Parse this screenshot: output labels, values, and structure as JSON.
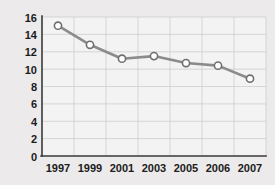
{
  "chart_data": {
    "type": "line",
    "title": "",
    "xlabel": "",
    "ylabel": "",
    "categories": [
      "1997",
      "1999",
      "2001",
      "2003",
      "2005",
      "2006",
      "2007"
    ],
    "values": [
      15.0,
      12.8,
      11.2,
      11.5,
      10.7,
      10.4,
      8.9
    ],
    "series": [
      {
        "name": "series-1",
        "values": [
          15.0,
          12.8,
          11.2,
          11.5,
          10.7,
          10.4,
          8.9
        ]
      }
    ],
    "ylim": [
      0,
      16
    ],
    "ytick_labels": [
      "0",
      "2",
      "4",
      "6",
      "8",
      "10",
      "12",
      "14",
      "16"
    ],
    "ytick_values": [
      0,
      2,
      4,
      6,
      8,
      10,
      12,
      14,
      16
    ],
    "xtick_labels": [
      "1997",
      "1999",
      "2001",
      "2003",
      "2005",
      "2006",
      "2007"
    ],
    "grid": true,
    "legend": false,
    "legend_position": "none",
    "marker": "open-circle",
    "line_color": "#8b8b8b",
    "marker_fill": "#ffffff",
    "marker_stroke": "#6f6f6f",
    "grid_color": "#c9c9c9",
    "axis_color": "#3a3a3a",
    "background_color": "#eceaea",
    "plot_background_color": "#f4f3f3"
  },
  "axes": {
    "y_labels": [
      {
        "text": "16",
        "value": 16
      },
      {
        "text": "14",
        "value": 14
      },
      {
        "text": "12",
        "value": 12
      },
      {
        "text": "10",
        "value": 10
      },
      {
        "text": "8",
        "value": 8
      },
      {
        "text": "6",
        "value": 6
      },
      {
        "text": "4",
        "value": 4
      },
      {
        "text": "2",
        "value": 2
      },
      {
        "text": "0",
        "value": 0
      }
    ],
    "x_labels": [
      {
        "text": "1997"
      },
      {
        "text": "1999"
      },
      {
        "text": "2001"
      },
      {
        "text": "2003"
      },
      {
        "text": "2005"
      },
      {
        "text": "2006"
      },
      {
        "text": "2007"
      }
    ]
  }
}
